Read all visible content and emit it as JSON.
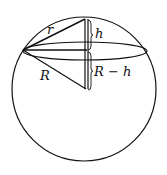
{
  "diagram": {
    "labels": {
      "small_radius": "r",
      "height": "h",
      "big_radius": "R",
      "remaining": "R − h"
    },
    "colors": {
      "stroke": "#111111",
      "background": "#ffffff"
    }
  }
}
